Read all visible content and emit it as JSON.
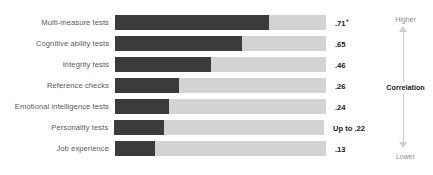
{
  "chart_data": {
    "type": "bar",
    "title": "",
    "subtitle": "",
    "xlabel": "",
    "ylabel": "",
    "orientation": "horizontal",
    "grid": false,
    "legend_position": "right",
    "xlim": [
      0,
      1.0
    ],
    "categories": [
      "Multi-measure tests",
      "Cognitive ability tests",
      "Integrity tests",
      "Reference checks",
      "Emotional intelligence tests",
      "Personality tests",
      "Job experience"
    ],
    "values": [
      0.71,
      0.65,
      0.46,
      0.26,
      0.24,
      0.22,
      0.13
    ],
    "value_labels": [
      ".71+",
      ".65",
      ".46",
      ".26",
      ".24",
      "Up to .22",
      ".13"
    ],
    "bar_fill_fraction": [
      0.73,
      0.6,
      0.455,
      0.305,
      0.255,
      0.235,
      0.19
    ],
    "colors": {
      "bar_fill": "#3b3b3b",
      "bar_track": "#d2d3d4",
      "label_text": "#58595b",
      "value_text": "#1a1a1a",
      "axis_line": "#cfcfcf",
      "axis_cap_text": "#8d8e90",
      "background": "#ffffff"
    }
  },
  "rows": [
    {
      "label": "Multi-measure tests",
      "value_number": ".71",
      "value_suffix": "+",
      "fill_pct": 73.0
    },
    {
      "label": "Cognitive ability tests",
      "value_number": ".65",
      "value_suffix": "",
      "fill_pct": 60.0
    },
    {
      "label": "Integrity tests",
      "value_number": ".46",
      "value_suffix": "",
      "fill_pct": 45.5
    },
    {
      "label": "Reference checks",
      "value_number": ".26",
      "value_suffix": "",
      "fill_pct": 30.5
    },
    {
      "label": "Emotional intelligence tests",
      "value_number": ".24",
      "value_suffix": "",
      "fill_pct": 25.5
    },
    {
      "label": "Personality tests",
      "value_number": "Up to .22",
      "value_suffix": "",
      "fill_pct": 23.5
    },
    {
      "label": "Job experience",
      "value_number": ".13",
      "value_suffix": "",
      "fill_pct": 19.0
    }
  ],
  "axis": {
    "top_label": "Higher",
    "middle_label": "Correlation",
    "bottom_label": "Lower"
  }
}
